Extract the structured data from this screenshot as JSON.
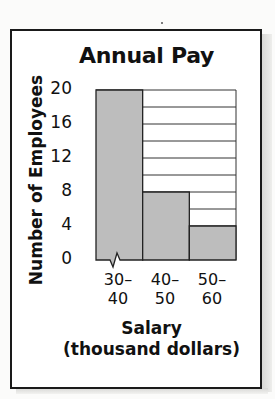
{
  "chart_data": {
    "type": "bar",
    "subtype": "histogram",
    "title": "Annual Pay",
    "xlabel": "Salary",
    "xlabel_unit": "(thousand dollars)",
    "ylabel": "Number of Employees",
    "categories": [
      "30–40",
      "40–50",
      "50–60"
    ],
    "category_lines": [
      [
        "30–",
        "40"
      ],
      [
        "40–",
        "50"
      ],
      [
        "50–",
        "60"
      ]
    ],
    "values": [
      20,
      8,
      4
    ],
    "ylim": [
      0,
      20
    ],
    "yticks": [
      0,
      4,
      8,
      12,
      16,
      20
    ],
    "grid": {
      "horizontal": true,
      "step": 2
    },
    "axis_break": "x-axis break symbol at left of first bar",
    "bar_color": "#bdbdbd",
    "legend": null
  }
}
